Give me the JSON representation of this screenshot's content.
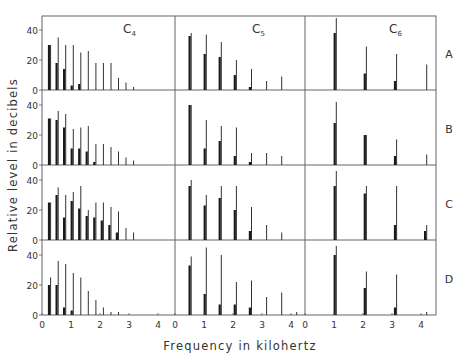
{
  "chart_data": {
    "type": "bar",
    "title": "",
    "xlabel": "Frequency in kilohertz",
    "ylabel": "Relative level in decibels",
    "xlim": [
      0,
      4.5
    ],
    "ylim": [
      0,
      50
    ],
    "x_ticks": [
      "0",
      "1",
      "2",
      "3",
      "4"
    ],
    "y_ticks": [
      "0",
      "20",
      "40"
    ],
    "columns": [
      "C4",
      "C5",
      "C6"
    ],
    "column_labels": [
      {
        "base": "C",
        "sub": "4"
      },
      {
        "base": "C",
        "sub": "5"
      },
      {
        "base": "C",
        "sub": "6"
      }
    ],
    "rows": [
      "A",
      "B",
      "C",
      "D"
    ],
    "panels": {
      "A": {
        "C4": {
          "freqs": [
            0.26,
            0.52,
            0.78,
            1.04,
            1.3,
            1.56,
            1.82,
            2.08,
            2.34,
            2.6,
            2.86,
            3.12
          ],
          "thin": [
            30,
            35,
            30,
            30,
            25,
            26,
            18,
            18,
            18,
            8,
            5,
            2
          ],
          "thick": [
            30,
            18,
            14,
            3,
            4,
            0,
            0,
            0,
            0,
            0,
            0,
            0
          ]
        },
        "C5": {
          "freqs": [
            0.52,
            1.04,
            1.56,
            2.08,
            2.6,
            3.12,
            3.64
          ],
          "thin": [
            38,
            37,
            32,
            20,
            14,
            6,
            9
          ],
          "thick": [
            36,
            24,
            22,
            10,
            2,
            0,
            0
          ]
        },
        "C6": {
          "freqs": [
            1.04,
            2.08,
            3.12,
            4.16
          ],
          "thin": [
            48,
            29,
            24,
            17
          ],
          "thick": [
            38,
            11,
            6,
            0
          ]
        }
      },
      "B": {
        "C4": {
          "freqs": [
            0.26,
            0.52,
            0.78,
            1.04,
            1.3,
            1.56,
            1.82,
            2.08,
            2.34,
            2.6,
            2.86,
            3.12
          ],
          "thin": [
            31,
            36,
            34,
            24,
            25,
            26,
            14,
            14,
            12,
            9,
            5,
            3
          ],
          "thick": [
            31,
            30,
            25,
            11,
            11,
            9,
            2,
            0,
            0,
            0,
            0,
            0
          ]
        },
        "C5": {
          "freqs": [
            0.52,
            1.04,
            1.56,
            2.08,
            2.6,
            3.12,
            3.64
          ],
          "thin": [
            40,
            30,
            26,
            25,
            8,
            8,
            6
          ],
          "thick": [
            40,
            11,
            16,
            6,
            2,
            0,
            0
          ]
        },
        "C6": {
          "freqs": [
            1.04,
            2.08,
            3.12,
            4.16
          ],
          "thin": [
            42,
            20,
            17,
            7
          ],
          "thick": [
            28,
            20,
            6,
            0
          ]
        }
      },
      "C": {
        "C4": {
          "freqs": [
            0.26,
            0.52,
            0.78,
            1.04,
            1.3,
            1.56,
            1.82,
            2.08,
            2.34,
            2.6,
            2.86,
            3.12
          ],
          "thin": [
            25,
            35,
            30,
            32,
            36,
            20,
            25,
            25,
            22,
            19,
            8,
            5
          ],
          "thick": [
            25,
            30,
            15,
            26,
            21,
            16,
            15,
            13,
            10,
            5,
            0,
            0
          ]
        },
        "C5": {
          "freqs": [
            0.52,
            1.04,
            1.56,
            2.08,
            2.6,
            3.12,
            3.64
          ],
          "thin": [
            40,
            30,
            36,
            36,
            22,
            10,
            5
          ],
          "thick": [
            36,
            23,
            28,
            20,
            6,
            0,
            0
          ]
        },
        "C6": {
          "freqs": [
            1.04,
            2.08,
            3.12,
            4.16
          ],
          "thin": [
            46,
            36,
            36,
            10
          ],
          "thick": [
            36,
            31,
            10,
            6
          ]
        }
      },
      "D": {
        "C4": {
          "freqs": [
            0.26,
            0.52,
            0.78,
            1.04,
            1.3,
            1.56,
            1.82,
            2.08,
            2.34,
            2.6
          ],
          "thin": [
            25,
            36,
            34,
            28,
            25,
            16,
            10,
            5,
            2,
            2
          ],
          "thick": [
            20,
            20,
            5,
            3,
            0,
            0,
            0,
            0,
            0,
            0
          ]
        },
        "C5": {
          "freqs": [
            0.52,
            1.04,
            1.56,
            2.08,
            2.6,
            3.12,
            3.64,
            4.16
          ],
          "thin": [
            39,
            45,
            40,
            22,
            23,
            12,
            15,
            2
          ],
          "thick": [
            33,
            14,
            7,
            7,
            5,
            0,
            0,
            0
          ]
        },
        "C6": {
          "freqs": [
            1.04,
            2.08,
            3.12,
            4.16
          ],
          "thin": [
            46,
            29,
            27,
            2
          ],
          "thick": [
            40,
            18,
            5,
            0
          ]
        }
      }
    },
    "legend": null,
    "grid": false
  }
}
